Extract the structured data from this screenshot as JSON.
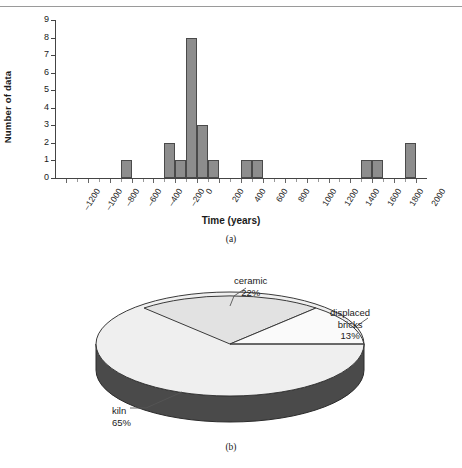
{
  "figure_a": {
    "caption": "(a)",
    "chart_data": {
      "type": "bar",
      "title": "",
      "xlabel": "Time (years)",
      "ylabel": "Number of data",
      "ylim": [
        0,
        9
      ],
      "yticks": [
        0,
        1,
        2,
        3,
        4,
        5,
        6,
        7,
        8,
        9
      ],
      "xlim": [
        -1300,
        2100
      ],
      "bin_width": 100,
      "xticks": [
        -1200,
        -1000,
        -800,
        -600,
        -400,
        -200,
        0,
        200,
        400,
        600,
        800,
        1000,
        1200,
        1400,
        1600,
        1800,
        2000
      ],
      "xticklabels": [
        "–1200",
        "–1000",
        "–800",
        "–600",
        "–400",
        "–200",
        "0",
        "200",
        "400",
        "600",
        "800",
        "1000",
        "1200",
        "1400",
        "1600",
        "1800",
        "2000"
      ],
      "grid": false,
      "legend": "none",
      "bars": [
        {
          "x": -650,
          "value": 1
        },
        {
          "x": -250,
          "value": 2
        },
        {
          "x": -150,
          "value": 1
        },
        {
          "x": -50,
          "value": 8
        },
        {
          "x": 50,
          "value": 3
        },
        {
          "x": 150,
          "value": 1
        },
        {
          "x": 450,
          "value": 1
        },
        {
          "x": 550,
          "value": 1
        },
        {
          "x": 1550,
          "value": 1
        },
        {
          "x": 1650,
          "value": 1
        },
        {
          "x": 1950,
          "value": 2
        }
      ],
      "categories": [
        "-650",
        "-250",
        "-150",
        "-50",
        "50",
        "150",
        "450",
        "550",
        "1550",
        "1650",
        "1950"
      ],
      "values": [
        1,
        2,
        1,
        8,
        3,
        1,
        1,
        1,
        1,
        1,
        2
      ],
      "bar_color": "#8d8d8d",
      "bar_edge_color": "#4a4a4a"
    }
  },
  "figure_b": {
    "caption": "(b)",
    "chart_data": {
      "type": "pie",
      "title": "",
      "three_d": true,
      "labels": [
        "ceramic",
        "displaced bricks",
        "kiln"
      ],
      "values": [
        22,
        13,
        65
      ],
      "slices": [
        {
          "name": "ceramic",
          "label_line1": "ceramic",
          "label_line2": "22%",
          "percent": 22,
          "color": "#e8e8e8"
        },
        {
          "name": "displaced bricks",
          "label_line1": "displaced",
          "label_line2": "bricks",
          "label_line3": "13%",
          "percent": 13,
          "color": "#f4f4f4"
        },
        {
          "name": "kiln",
          "label_line1": "kiln",
          "label_line2": "65%",
          "percent": 65,
          "color": "#4a4a4a"
        }
      ],
      "legend": "labels-outside"
    }
  }
}
